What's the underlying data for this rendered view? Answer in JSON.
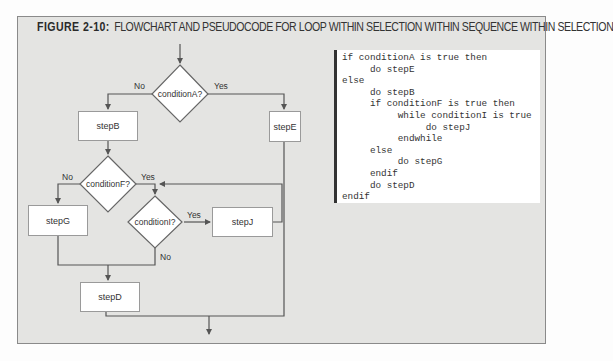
{
  "figure": {
    "label": "FIGURE 2-10:",
    "title": "FLOWCHART AND PSEUDOCODE FOR LOOP WITHIN SELECTION WITHIN SEQUENCE WITHIN SELECTION"
  },
  "flowchart": {
    "decisions": {
      "conditionA": "conditionA?",
      "conditionF": "conditionF?",
      "conditionI": "conditionI?"
    },
    "steps": {
      "stepB": "stepB",
      "stepE": "stepE",
      "stepG": "stepG",
      "stepJ": "stepJ",
      "stepD": "stepD"
    },
    "edge_labels": {
      "a_no": "No",
      "a_yes": "Yes",
      "f_no": "No",
      "f_yes": "Yes",
      "i_yes": "Yes",
      "i_no": "No"
    },
    "colors": {
      "line": "#555555",
      "box_fill": "#ffffff",
      "background": "#e4e4e2"
    }
  },
  "pseudocode": {
    "lines": [
      "if conditionA is true then",
      "     do stepE",
      "else",
      "     do stepB",
      "     if conditionF is true then",
      "          while conditionI is true",
      "               do stepJ",
      "          endwhile",
      "     else",
      "          do stepG",
      "     endif",
      "     do stepD",
      "endif"
    ]
  }
}
